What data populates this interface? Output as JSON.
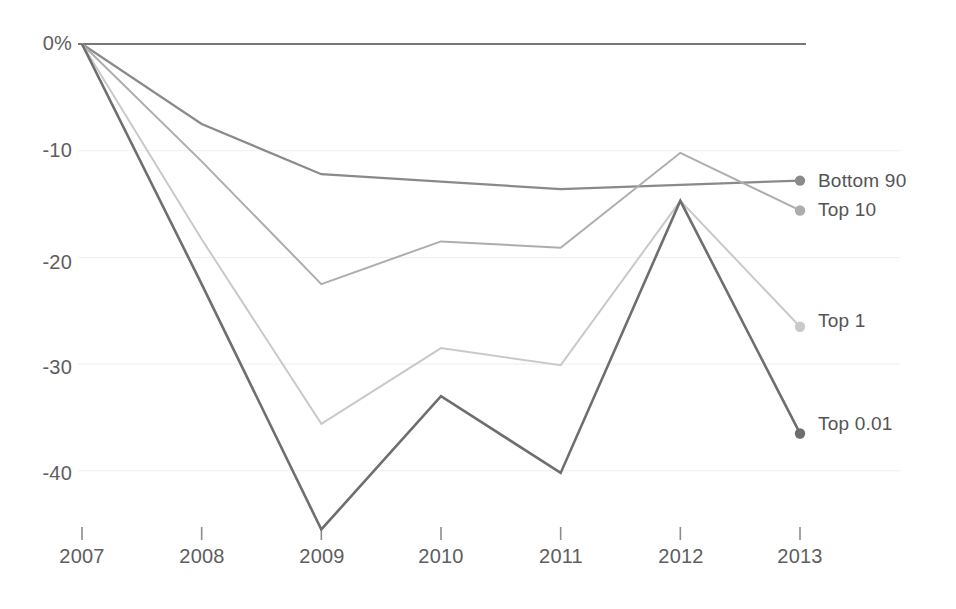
{
  "chart_data": {
    "type": "line",
    "title": "",
    "subtitle": "",
    "xlabel": "",
    "ylabel": "",
    "categories": [
      "2007",
      "2008",
      "2009",
      "2010",
      "2011",
      "2012",
      "2013"
    ],
    "x": [
      2007,
      2008,
      2009,
      2010,
      2011,
      2012,
      2013
    ],
    "xlim": [
      2007,
      2013
    ],
    "ylim": [
      -47,
      0
    ],
    "y_ticks": [
      0,
      -10,
      -20,
      -30,
      -40
    ],
    "y_tick_labels": [
      "0%",
      "-10",
      "-20",
      "-30",
      "-40"
    ],
    "grid": true,
    "grid_axis": "y",
    "legend": "right-inline-endpoint-labels",
    "value_unit": "percent",
    "series": [
      {
        "name": "Bottom 90",
        "color": "#8a8a8a",
        "width": 2.2,
        "marker": "circle",
        "marker_at_end": true,
        "values": [
          0,
          -7.5,
          -12.2,
          -12.9,
          -13.6,
          -13.2,
          -12.8
        ]
      },
      {
        "name": "Top 10",
        "color": "#adadad",
        "width": 2.0,
        "marker": "circle",
        "marker_at_end": true,
        "values": [
          0,
          -11.0,
          -22.5,
          -18.5,
          -19.1,
          -10.2,
          -15.6
        ]
      },
      {
        "name": "Top 1",
        "color": "#c9c9c9",
        "width": 2.0,
        "marker": "circle",
        "marker_at_end": true,
        "values": [
          0,
          -18.3,
          -35.6,
          -28.5,
          -30.1,
          -14.7,
          -26.5
        ]
      },
      {
        "name": "Top 0.01",
        "color": "#6e6e6e",
        "width": 2.6,
        "marker": "circle",
        "marker_at_end": true,
        "values": [
          0,
          -22.5,
          -45.5,
          -33.0,
          -40.2,
          -14.7,
          -36.5
        ]
      }
    ],
    "colors": {
      "baseline": "#777777",
      "gridline": "#f0eef0",
      "tick_mark": "#8c8c8c",
      "tick_text": "#5e5e5e",
      "series_label_text": "#545454",
      "background": "#ffffff"
    }
  },
  "axes": {
    "y_labels": [
      {
        "text": "0%",
        "top": 32,
        "left": 8
      },
      {
        "text": "-10",
        "top": 139,
        "left": 8
      },
      {
        "text": "-20",
        "top": 251,
        "left": 8
      },
      {
        "text": "-30",
        "top": 356,
        "left": 8
      },
      {
        "text": "-40",
        "top": 462,
        "left": 8
      }
    ],
    "x_labels": [
      {
        "text": "2007",
        "left": 37,
        "top": 545
      },
      {
        "text": "2008",
        "left": 157,
        "top": 545
      },
      {
        "text": "2009",
        "left": 277,
        "top": 545
      },
      {
        "text": "2010",
        "left": 396,
        "top": 545
      },
      {
        "text": "2011",
        "left": 516,
        "top": 545
      },
      {
        "text": "2012",
        "left": 636,
        "top": 545
      },
      {
        "text": "2013",
        "left": 755,
        "top": 545
      }
    ]
  },
  "series_labels": [
    {
      "text": "Bottom 90",
      "left": 818,
      "top": 170
    },
    {
      "text": "Top 10",
      "left": 818,
      "top": 199
    },
    {
      "text": "Top 1",
      "left": 818,
      "top": 310
    },
    {
      "text": "Top 0.01",
      "left": 818,
      "top": 413
    }
  ]
}
